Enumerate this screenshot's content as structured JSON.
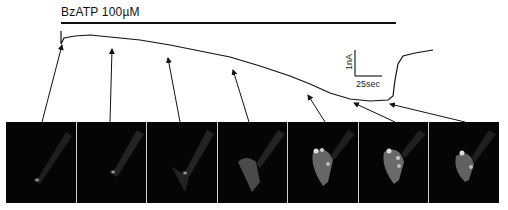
{
  "figure": {
    "drug_label": "BzATP 100µM",
    "scale_bar": {
      "vertical_label": "1nA",
      "horizontal_label": "25sec"
    },
    "trace": {
      "description": "Whole-cell current trace during BzATP application",
      "points": [
        [
          61,
          31
        ],
        [
          61,
          44
        ],
        [
          64,
          38
        ],
        [
          75,
          36
        ],
        [
          90,
          35
        ],
        [
          110,
          37
        ],
        [
          140,
          40
        ],
        [
          170,
          45
        ],
        [
          200,
          51
        ],
        [
          230,
          57
        ],
        [
          260,
          66
        ],
        [
          290,
          76
        ],
        [
          310,
          84
        ],
        [
          330,
          93
        ],
        [
          350,
          99
        ],
        [
          370,
          101
        ],
        [
          388,
          100
        ],
        [
          393,
          96
        ],
        [
          395,
          80
        ],
        [
          398,
          64
        ],
        [
          403,
          56
        ],
        [
          415,
          53
        ],
        [
          433,
          50
        ]
      ]
    },
    "application_bar": {
      "x1": 61,
      "x2": 396,
      "y": 23
    },
    "panels": [
      {
        "label": "frame-1",
        "arrow_to": [
          62,
          45
        ],
        "arrow_from": [
          42,
          122
        ]
      },
      {
        "label": "frame-2",
        "arrow_to": [
          112,
          49
        ],
        "arrow_from": [
          110,
          122
        ]
      },
      {
        "label": "frame-3",
        "arrow_to": [
          168,
          58
        ],
        "arrow_from": [
          180,
          122
        ]
      },
      {
        "label": "frame-4",
        "arrow_to": [
          233,
          70
        ],
        "arrow_from": [
          249,
          122
        ]
      },
      {
        "label": "frame-5",
        "arrow_to": [
          308,
          95
        ],
        "arrow_from": [
          325,
          122
        ]
      },
      {
        "label": "frame-6",
        "arrow_to": [
          354,
          103
        ],
        "arrow_from": [
          395,
          122
        ]
      },
      {
        "label": "frame-7",
        "arrow_to": [
          390,
          104
        ],
        "arrow_from": [
          465,
          122
        ]
      }
    ]
  }
}
